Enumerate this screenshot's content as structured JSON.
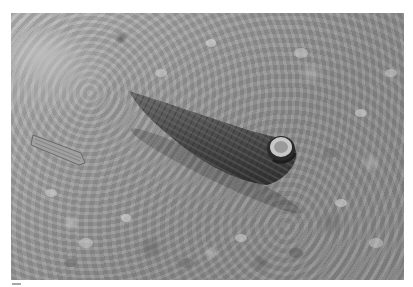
{
  "image": {
    "description": "Grayscale photograph of a cone-shaped spiral snail shell (cerith/horn snail) lying on a wet muddy surface",
    "subject": "snail shell",
    "background": "wet mud with small stones and shell fragments",
    "colors": {
      "mud_light": "#b9b9b9",
      "mud_dark": "#8a8a8a",
      "shell_dark": "#3c3c3c",
      "shell_mid": "#5e5e5e",
      "aperture_light": "#c8c8c8"
    }
  }
}
